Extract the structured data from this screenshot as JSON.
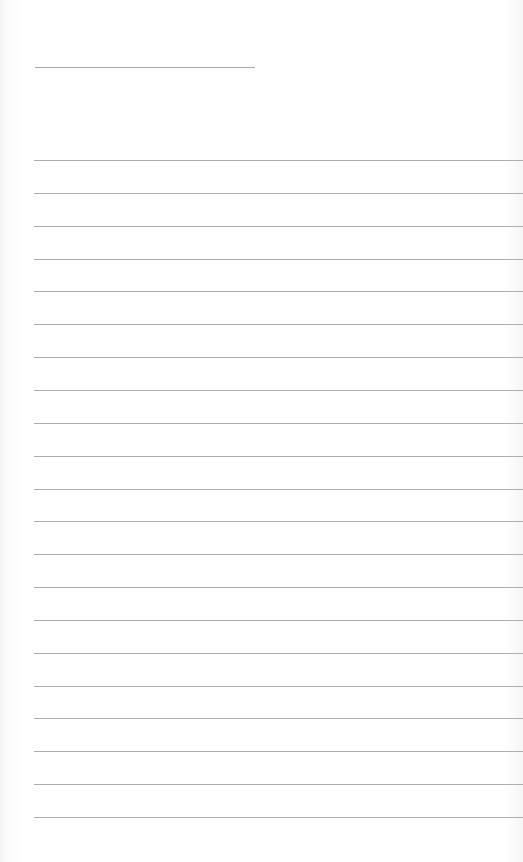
{
  "page": {
    "type": "lined-paper",
    "background_color": "#ffffff",
    "line_color": "#aeaeae",
    "header_line": {
      "x": 35,
      "y": 67,
      "width": 220
    },
    "rules": {
      "count": 21,
      "first_y": 160,
      "spacing": 32.85,
      "x_start": 34
    },
    "text": []
  }
}
